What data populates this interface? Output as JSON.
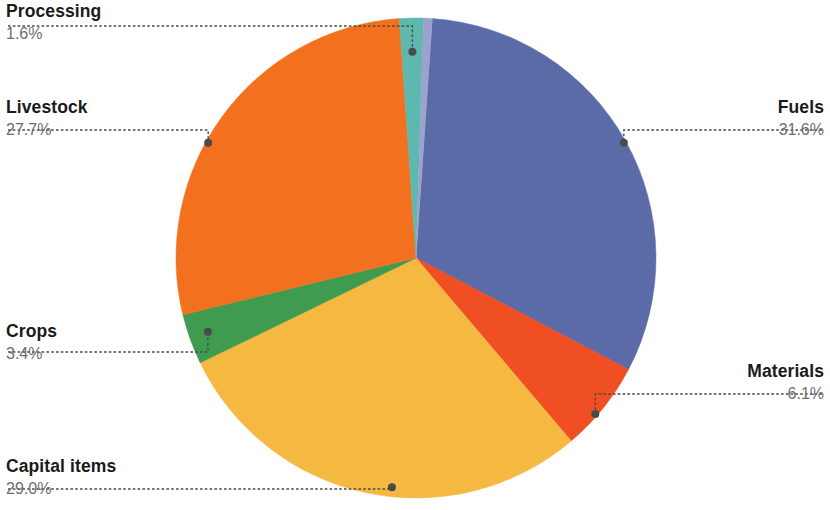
{
  "chart_data": {
    "type": "pie",
    "title": "",
    "subtitle": "",
    "xlabel": "",
    "ylabel": "",
    "legend_position": "callout-labels",
    "grid": false,
    "value_unit": "percent",
    "categories": [
      "Fuels",
      "Materials",
      "Capital items",
      "Crops",
      "Livestock",
      "Processing"
    ],
    "values": [
      31.6,
      6.1,
      29.0,
      3.4,
      27.7,
      1.6
    ],
    "labels": [
      "31.6%",
      "6.1%",
      "29.0%",
      "3.4%",
      "27.7%",
      "1.6%"
    ],
    "colors": [
      "#5b6ba8",
      "#f04e23",
      "#f5b942",
      "#3e9b4f",
      "#f2701e",
      "#5fb8ae"
    ],
    "slices": [
      {
        "name": "Fuels",
        "value": 31.6,
        "label": "31.6%",
        "color": "#5b6ba8",
        "start_angle": 3.9,
        "end_angle": 117.7
      },
      {
        "name": "Materials",
        "value": 6.1,
        "label": "6.1%",
        "color": "#f04e23",
        "start_angle": 117.7,
        "end_angle": 139.7
      },
      {
        "name": "Capital items",
        "value": 29.0,
        "label": "29.0%",
        "color": "#f5b942",
        "start_angle": 139.7,
        "end_angle": 244.1
      },
      {
        "name": "Crops",
        "value": 3.4,
        "label": "3.4%",
        "color": "#3e9b4f",
        "start_angle": 244.1,
        "end_angle": 256.3
      },
      {
        "name": "Livestock",
        "value": 27.7,
        "label": "27.7%",
        "color": "#f2701e",
        "start_angle": 256.3,
        "end_angle": 356.0
      },
      {
        "name": "Processing",
        "value": 1.6,
        "label": "1.6%",
        "color": "#5fb8ae",
        "start_angle": 356.0,
        "end_angle": 361.8
      },
      {
        "name": "",
        "value": 0.6,
        "label": "",
        "color": "#9aa3cd",
        "start_angle": 361.8,
        "end_angle": 363.9
      }
    ]
  },
  "callouts": {
    "processing": {
      "name": "Processing",
      "pct": "1.6%"
    },
    "livestock": {
      "name": "Livestock",
      "pct": "27.7%"
    },
    "crops": {
      "name": "Crops",
      "pct": "3.4%"
    },
    "capital_items": {
      "name": "Capital items",
      "pct": "29.0%"
    },
    "fuels": {
      "name": "Fuels",
      "pct": "31.6%"
    },
    "materials": {
      "name": "Materials",
      "pct": "6.1%"
    }
  },
  "style": {
    "leader_color": "#4a4a4a",
    "name_color": "#1a1a1a",
    "pct_color": "#6e6e6e",
    "background": "#ffffff"
  },
  "geometry": {
    "center_x": 416,
    "center_y": 258,
    "radius": 240
  }
}
